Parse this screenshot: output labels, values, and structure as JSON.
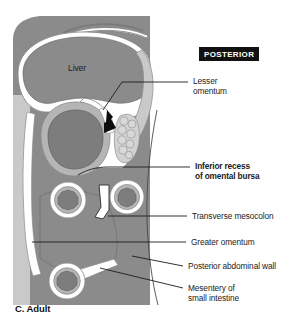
{
  "figure": {
    "panel_caption": "C. Adult",
    "orientation_badge": "POSTERIOR",
    "organ_labels": [
      {
        "name": "liver",
        "text": "Liver"
      }
    ],
    "annotations": [
      {
        "name": "lesser-omentum",
        "line1": "Lesser",
        "line2": "omentum",
        "bold": false
      },
      {
        "name": "inferior-recess-of-omental-bursa",
        "line1": "Inferior recess",
        "line2": "of omental bursa",
        "bold": true
      },
      {
        "name": "transverse-mesocolon",
        "line1": "Transverse mesocolon",
        "line2": "",
        "bold": false
      },
      {
        "name": "greater-omentum",
        "line1": "Greater omentum",
        "line2": "",
        "bold": false
      },
      {
        "name": "posterior-abdominal-wall",
        "line1": "Posterior abdominal wall",
        "line2": "",
        "bold": false
      },
      {
        "name": "mesentery-of-small-intestine",
        "line1": "Mesentery of",
        "line2": "small intestine",
        "bold": false
      }
    ],
    "colors": {
      "background": "#ffffff",
      "organ_dark_gray": "#8b8b8b",
      "organ_mid_gray": "#a9a9a9",
      "organ_light_gray": "#c9c9c9",
      "peritoneum_white": "#ffffff",
      "outline_gray": "#6f6f6f",
      "leader_line": "#1b1b1b",
      "text": "#1b1b1b",
      "badge_background": "#111111",
      "badge_text": "#ffffff"
    }
  }
}
